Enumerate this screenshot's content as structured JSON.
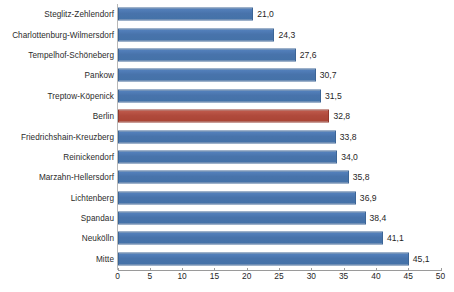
{
  "chart_data": {
    "type": "bar",
    "orientation": "horizontal",
    "title": "",
    "subtitle": "",
    "xlabel": "",
    "ylabel": "",
    "xlim": [
      0,
      50
    ],
    "xticks": [
      0,
      5,
      10,
      15,
      20,
      25,
      30,
      35,
      40,
      45,
      50
    ],
    "xtick_labels": [
      "0",
      "5",
      "10",
      "15",
      "20",
      "25",
      "30",
      "35",
      "40",
      "45",
      "50"
    ],
    "grid": false,
    "legend": false,
    "decimal_separator": ",",
    "categories": [
      "Steglitz-Zehlendorf",
      "Charlottenburg-Wilmersdorf",
      "Tempelhof-Schöneberg",
      "Pankow",
      "Treptow-Köpenick",
      "Berlin",
      "Friedrichshain-Kreuzberg",
      "Reinickendorf",
      "Marzahn-Hellersdorf",
      "Lichtenberg",
      "Spandau",
      "Neukölln",
      "Mitte"
    ],
    "values": [
      21.0,
      24.3,
      27.6,
      30.7,
      31.5,
      32.8,
      33.8,
      34.0,
      35.8,
      36.9,
      38.4,
      41.1,
      45.1
    ],
    "value_labels": [
      "21,0",
      "24,3",
      "27,6",
      "30,7",
      "31,5",
      "32,8",
      "33,8",
      "34,0",
      "35,8",
      "36,9",
      "38,4",
      "41,1",
      "45,1"
    ],
    "highlight_index": 5,
    "colors": {
      "bar": "#4472a8",
      "bar_highlight": "#aa4435",
      "axis": "#9a9a9a",
      "text": "#1f1f1f",
      "background": "#ffffff"
    }
  }
}
